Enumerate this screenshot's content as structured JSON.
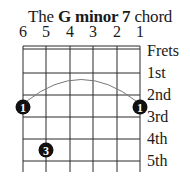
{
  "title": {
    "prefix": "The ",
    "chord": "G minor 7",
    "suffix": " chord"
  },
  "strings": [
    "6",
    "5",
    "4",
    "3",
    "2",
    "1"
  ],
  "frets": {
    "header": "Frets",
    "labels": [
      "1st",
      "2nd",
      "3rd",
      "4th",
      "5th"
    ]
  },
  "fingers": [
    {
      "string": 6,
      "fret": 3,
      "label": "1"
    },
    {
      "string": 1,
      "fret": 3,
      "label": "1"
    },
    {
      "string": 5,
      "fret": 5,
      "label": "3"
    }
  ],
  "barre": {
    "from_string": 6,
    "to_string": 1,
    "fret": 3
  },
  "colors": {
    "line": "#2a2a2a",
    "dot": "#111111",
    "dot_text": "#ffffff",
    "barre": "#777777"
  }
}
